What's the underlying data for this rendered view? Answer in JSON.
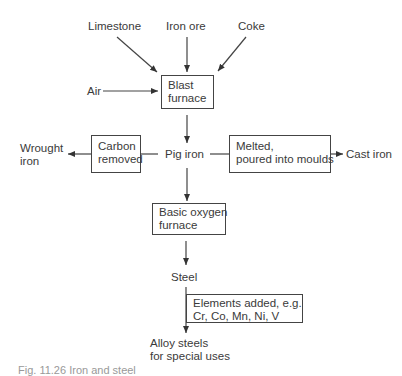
{
  "diagram": {
    "type": "flowchart",
    "inputs": {
      "limestone": "Limestone",
      "iron_ore": "Iron ore",
      "coke": "Coke",
      "air": "Air"
    },
    "nodes": {
      "blast_furnace": [
        "Blast",
        "furnace"
      ],
      "pig_iron": "Pig iron",
      "carbon_removed": [
        "Carbon",
        "removed"
      ],
      "melted": [
        "Melted,",
        "poured into moulds"
      ],
      "wrought_iron": [
        "Wrought",
        "iron"
      ],
      "cast_iron": "Cast iron",
      "basic_oxygen_furnace": [
        "Basic oxygen",
        "furnace"
      ],
      "steel": "Steel",
      "elements_added": [
        "Elements added, e.g.",
        "Cr, Co, Mn, Ni, V"
      ],
      "alloy_steels": [
        "Alloy steels",
        "for special uses"
      ]
    },
    "caption": "Fig. 11.26 Iron and steel"
  },
  "colors": {
    "line": "#444444",
    "text": "#3a3a3a",
    "background": "#ffffff"
  }
}
